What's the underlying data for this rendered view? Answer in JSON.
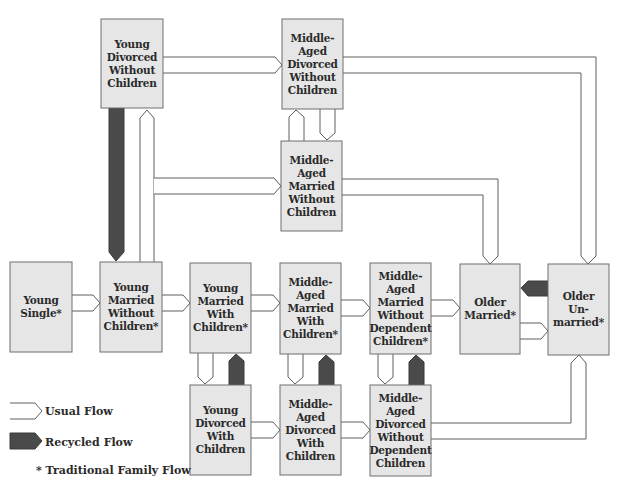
{
  "nodes": {
    "young_divorced_without_children": {
      "lines": [
        "Young",
        "Divorced",
        "Without",
        "Children"
      ],
      "traditional": false
    },
    "middle_aged_divorced_without_children": {
      "lines": [
        "Middle-",
        "Aged",
        "Divorced",
        "Without",
        "Children"
      ],
      "traditional": false
    },
    "middle_aged_married_without_children": {
      "lines": [
        "Middle-",
        "Aged",
        "Married",
        "Without",
        "Children"
      ],
      "traditional": false
    },
    "young_single": {
      "lines": [
        "Young",
        "Single*"
      ],
      "traditional": true
    },
    "young_married_without_children": {
      "lines": [
        "Young",
        "Married",
        "Without",
        "Children*"
      ],
      "traditional": true
    },
    "young_married_with_children": {
      "lines": [
        "Young",
        "Married",
        "With",
        "Children*"
      ],
      "traditional": true
    },
    "middle_aged_married_with_children": {
      "lines": [
        "Middle-",
        "Aged",
        "Married",
        "With",
        "Children*"
      ],
      "traditional": true
    },
    "middle_aged_married_without_dependent_children": {
      "lines": [
        "Middle-",
        "Aged",
        "Married",
        "Without",
        "Dependent",
        "Children*"
      ],
      "traditional": true
    },
    "older_married": {
      "lines": [
        "Older",
        "Married*"
      ],
      "traditional": true
    },
    "older_unmarried": {
      "lines": [
        "Older",
        "Un-",
        "married*"
      ],
      "traditional": true
    },
    "young_divorced_with_children": {
      "lines": [
        "Young",
        "Divorced",
        "With",
        "Children"
      ],
      "traditional": false
    },
    "middle_aged_divorced_with_children": {
      "lines": [
        "Middle-",
        "Aged",
        "Divorced",
        "With",
        "Children"
      ],
      "traditional": false
    },
    "middle_aged_divorced_without_dependent_children": {
      "lines": [
        "Middle-",
        "Aged",
        "Divorced",
        "Without",
        "Dependent",
        "Children"
      ],
      "traditional": false
    }
  },
  "edges": [
    {
      "from": "young_single",
      "to": "young_married_without_children",
      "type": "usual"
    },
    {
      "from": "young_married_without_children",
      "to": "young_married_with_children",
      "type": "usual"
    },
    {
      "from": "young_married_with_children",
      "to": "middle_aged_married_with_children",
      "type": "usual"
    },
    {
      "from": "middle_aged_married_with_children",
      "to": "middle_aged_married_without_dependent_children",
      "type": "usual"
    },
    {
      "from": "middle_aged_married_without_dependent_children",
      "to": "older_married",
      "type": "usual"
    },
    {
      "from": "older_married",
      "to": "older_unmarried",
      "type": "usual"
    },
    {
      "from": "older_unmarried",
      "to": "older_married",
      "type": "recycled"
    },
    {
      "from": "young_married_without_children",
      "to": "young_divorced_without_children",
      "type": "usual"
    },
    {
      "from": "young_divorced_without_children",
      "to": "young_married_without_children",
      "type": "recycled"
    },
    {
      "from": "young_married_without_children",
      "to": "middle_aged_married_without_children",
      "type": "usual"
    },
    {
      "from": "young_divorced_without_children",
      "to": "middle_aged_divorced_without_children",
      "type": "usual"
    },
    {
      "from": "middle_aged_married_without_children",
      "to": "middle_aged_divorced_without_children",
      "type": "usual"
    },
    {
      "from": "middle_aged_divorced_without_children",
      "to": "middle_aged_married_without_children",
      "type": "usual"
    },
    {
      "from": "middle_aged_married_without_children",
      "to": "older_married",
      "type": "usual"
    },
    {
      "from": "middle_aged_divorced_without_children",
      "to": "older_unmarried",
      "type": "usual"
    },
    {
      "from": "young_married_with_children",
      "to": "young_divorced_with_children",
      "type": "usual"
    },
    {
      "from": "young_divorced_with_children",
      "to": "young_married_with_children",
      "type": "recycled"
    },
    {
      "from": "middle_aged_married_with_children",
      "to": "middle_aged_divorced_with_children",
      "type": "usual"
    },
    {
      "from": "middle_aged_divorced_with_children",
      "to": "middle_aged_married_with_children",
      "type": "recycled"
    },
    {
      "from": "middle_aged_married_without_dependent_children",
      "to": "middle_aged_divorced_without_dependent_children",
      "type": "usual"
    },
    {
      "from": "middle_aged_divorced_without_dependent_children",
      "to": "middle_aged_married_without_dependent_children",
      "type": "recycled"
    },
    {
      "from": "young_divorced_with_children",
      "to": "middle_aged_divorced_with_children",
      "type": "usual"
    },
    {
      "from": "middle_aged_divorced_with_children",
      "to": "middle_aged_divorced_without_dependent_children",
      "type": "usual"
    },
    {
      "from": "middle_aged_divorced_without_dependent_children",
      "to": "older_unmarried",
      "type": "usual"
    }
  ],
  "legend": {
    "usual_flow": "Usual Flow",
    "recycled_flow": "Recycled Flow",
    "traditional_note": "* Traditional Family Flow"
  },
  "colors": {
    "box_fill": "#e6e6e6",
    "box_stroke": "#6e6e6e",
    "usual_fill": "#ffffff",
    "recycled_fill": "#4a4a4a",
    "text": "#2a2a2a"
  }
}
